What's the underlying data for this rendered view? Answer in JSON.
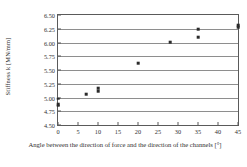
{
  "chart_data": {
    "type": "scatter",
    "title": "",
    "xlabel": "Angle between the direction of force and the direction of the channels  [°]",
    "ylabel": "Stiffness k [MN/mm]",
    "xlim": [
      0,
      45
    ],
    "ylim": [
      4.5,
      6.5
    ],
    "xticks": [
      0,
      5,
      10,
      15,
      20,
      25,
      30,
      35,
      40,
      45
    ],
    "xtick_labels": [
      "0",
      "5",
      "10",
      "15",
      "20",
      "25",
      "30",
      "35",
      "40",
      "45"
    ],
    "yticks": [
      4.5,
      4.75,
      5.0,
      5.25,
      5.5,
      5.75,
      6.0,
      6.25,
      6.5
    ],
    "ytick_labels": [
      "4.50",
      "4.75",
      "5.00",
      "5.25",
      "5.50",
      "5.75",
      "6.00",
      "6.25",
      "6.50"
    ],
    "grid": "horizontal",
    "legend": "none",
    "marker": "filled-square",
    "marker_color": "#2b2b2b",
    "points": [
      {
        "x": 0,
        "y": 4.98
      },
      {
        "x": 0,
        "y": 4.88
      },
      {
        "x": 0,
        "y": 4.85
      },
      {
        "x": 7,
        "y": 5.06
      },
      {
        "x": 10,
        "y": 5.17
      },
      {
        "x": 10,
        "y": 5.11
      },
      {
        "x": 20,
        "y": 5.62
      },
      {
        "x": 28,
        "y": 6.01
      },
      {
        "x": 35,
        "y": 6.24
      },
      {
        "x": 35,
        "y": 6.1
      },
      {
        "x": 45,
        "y": 6.31
      },
      {
        "x": 45,
        "y": 6.28
      }
    ]
  }
}
